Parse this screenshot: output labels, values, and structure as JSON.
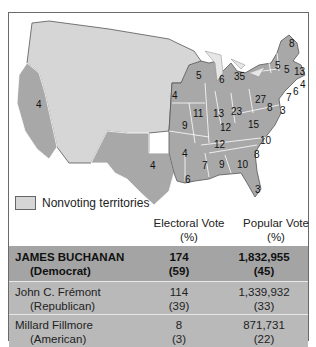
{
  "map": {
    "colors": {
      "voting_states": "#a8a8a8",
      "nonvoting_territories": "#d6d6d6",
      "borders": "#ffffff",
      "outline": "#555555"
    },
    "state_labels": [
      {
        "state": "California",
        "ev": "4"
      },
      {
        "state": "Texas",
        "ev": "4"
      },
      {
        "state": "Wisconsin",
        "ev": "5"
      },
      {
        "state": "Michigan",
        "ev": "6"
      },
      {
        "state": "Iowa",
        "ev": "4"
      },
      {
        "state": "Illinois",
        "ev": "11"
      },
      {
        "state": "Indiana",
        "ev": "13"
      },
      {
        "state": "Ohio",
        "ev": "23"
      },
      {
        "state": "Pennsylvania",
        "ev": "27"
      },
      {
        "state": "New York",
        "ev": "35"
      },
      {
        "state": "Maine",
        "ev": "8"
      },
      {
        "state": "Vermont",
        "ev": "5"
      },
      {
        "state": "New Hampshire",
        "ev": "5"
      },
      {
        "state": "Massachusetts",
        "ev": "13"
      },
      {
        "state": "Rhode Island",
        "ev": "4"
      },
      {
        "state": "Connecticut",
        "ev": "6"
      },
      {
        "state": "New Jersey",
        "ev": "7"
      },
      {
        "state": "Maryland",
        "ev": "8"
      },
      {
        "state": "Delaware",
        "ev": "3"
      },
      {
        "state": "Virginia",
        "ev": "15"
      },
      {
        "state": "Missouri",
        "ev": "9"
      },
      {
        "state": "Kentucky",
        "ev": "12"
      },
      {
        "state": "Tennessee",
        "ev": "12"
      },
      {
        "state": "North Carolina",
        "ev": "10"
      },
      {
        "state": "South Carolina",
        "ev": "8"
      },
      {
        "state": "Arkansas",
        "ev": "4"
      },
      {
        "state": "Mississippi",
        "ev": "7"
      },
      {
        "state": "Alabama",
        "ev": "9"
      },
      {
        "state": "Georgia",
        "ev": "10"
      },
      {
        "state": "Louisiana",
        "ev": "6"
      },
      {
        "state": "Florida",
        "ev": "3"
      }
    ]
  },
  "legend": {
    "label": "Nonvoting territories"
  },
  "table": {
    "headers": {
      "electoral": "Electoral Vote",
      "electoral_sub": "(%)",
      "popular": "Popular Vote",
      "popular_sub": "(%)"
    },
    "rows": [
      {
        "name": "JAMES BUCHANAN",
        "party": "(Democrat)",
        "ev": "174",
        "ev_pct": "(59)",
        "pv": "1,832,955",
        "pv_pct": "(45)",
        "winner": true
      },
      {
        "name": "John C. Frémont",
        "party": "(Republican)",
        "ev": "114",
        "ev_pct": "(39)",
        "pv": "1,339,932",
        "pv_pct": "(33)",
        "winner": false
      },
      {
        "name": "Millard Fillmore",
        "party": "(American)",
        "ev": "8",
        "ev_pct": "(3)",
        "pv": "871,731",
        "pv_pct": "(22)",
        "winner": false
      }
    ]
  }
}
